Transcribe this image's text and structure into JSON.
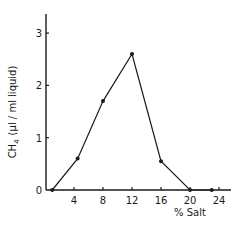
{
  "chart_data": {
    "type": "line",
    "title": "",
    "xlabel": "% Salt",
    "ylabel": "CH4 (µl / ml liquid)",
    "ylabel_parts": {
      "main": "CH",
      "sub": "4",
      "rest": "(µl / ml liquid)"
    },
    "x": [
      1,
      4.5,
      8,
      12,
      16,
      20,
      23
    ],
    "series": [
      {
        "name": "CH4",
        "values": [
          0,
          0.6,
          1.7,
          2.6,
          0.55,
          0,
          0
        ]
      }
    ],
    "xlim": [
      0,
      25
    ],
    "ylim": [
      0,
      3.4
    ],
    "xticks": [
      4,
      8,
      12,
      16,
      20,
      24
    ],
    "yticks": [
      0,
      1,
      2,
      3
    ],
    "grid": false,
    "legend": null
  }
}
